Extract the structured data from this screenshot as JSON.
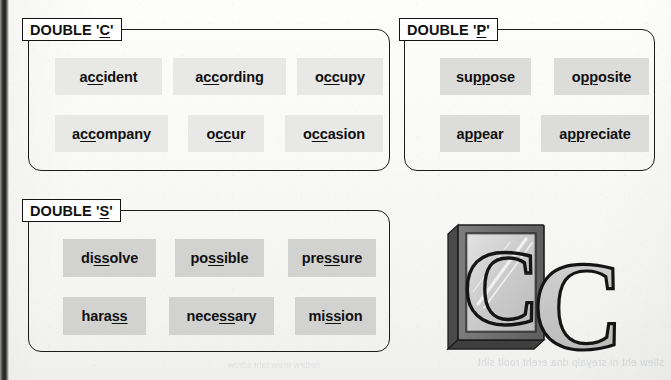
{
  "page": {
    "kind": "spelling-worksheet-scan",
    "background_color": "#f8f8f6"
  },
  "bleed_through": {
    "line1": "sllew eht ni sreyalp dna ereht roolf siht",
    "line2": "nettirw erew taht sdrow"
  },
  "panels": [
    {
      "id": "double-c",
      "title_prefix": "DOUBLE '",
      "title_letter": "C",
      "title_suffix": "'",
      "title_full": "DOUBLE 'C'",
      "chip_shade": "light",
      "words": [
        {
          "before": "a",
          "double": "cc",
          "after": "ident",
          "full": "accident"
        },
        {
          "before": "a",
          "double": "cc",
          "after": "ording",
          "full": "according"
        },
        {
          "before": "o",
          "double": "cc",
          "after": "upy",
          "full": "occupy"
        },
        {
          "before": "a",
          "double": "cc",
          "after": "ompany",
          "full": "accompany"
        },
        {
          "before": "o",
          "double": "cc",
          "after": "ur",
          "full": "occur"
        },
        {
          "before": "o",
          "double": "cc",
          "after": "asion",
          "full": "occasion"
        }
      ]
    },
    {
      "id": "double-p",
      "title_prefix": "DOUBLE '",
      "title_letter": "P",
      "title_suffix": "'",
      "title_full": "DOUBLE 'P'",
      "chip_shade": "mid",
      "words": [
        {
          "before": "su",
          "double": "pp",
          "after": "ose",
          "full": "suppose"
        },
        {
          "before": "o",
          "double": "pp",
          "after": "osite",
          "full": "opposite"
        },
        {
          "before": "a",
          "double": "pp",
          "after": "ear",
          "full": "appear"
        },
        {
          "before": "a",
          "double": "pp",
          "after": "reciate",
          "full": "appreciate"
        }
      ]
    },
    {
      "id": "double-s",
      "title_prefix": "DOUBLE '",
      "title_letter": "S",
      "title_suffix": "'",
      "title_full": "DOUBLE 'S'",
      "chip_shade": "dark",
      "words": [
        {
          "before": "di",
          "double": "ss",
          "after": "olve",
          "full": "dissolve"
        },
        {
          "before": "po",
          "double": "ss",
          "after": "ible",
          "full": "possible"
        },
        {
          "before": "pre",
          "double": "ss",
          "after": "ure",
          "full": "pressure"
        },
        {
          "before": "hara",
          "double": "ss",
          "after": "",
          "full": "harass"
        },
        {
          "before": "nece",
          "double": "ss",
          "after": "ary",
          "full": "necessary"
        },
        {
          "before": "mi",
          "double": "ss",
          "after": "ion",
          "full": "mission"
        }
      ]
    }
  ],
  "illustration": {
    "name": "mirror-with-letter-c",
    "description": "A framed mirror showing the letter C, with a second reflected C standing beside it",
    "letter": "C",
    "frame_color": "#6f6f6f",
    "glass_color": "#cfcfcf",
    "letter_color": "#c4c4c4",
    "outline_color": "#1a1a1a"
  }
}
